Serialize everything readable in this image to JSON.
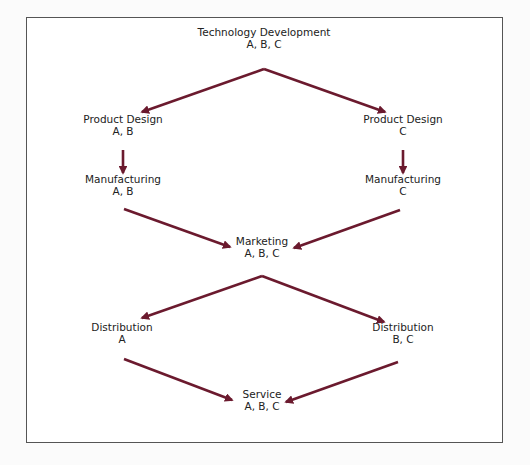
{
  "diagram": {
    "arrow_color": "#6b1a2e",
    "nodes": [
      {
        "id": "tech",
        "label": "Technology Development",
        "sub": "A, B, C",
        "x": 264,
        "y": 38
      },
      {
        "id": "pd_ab",
        "label": "Product Design",
        "sub": "A, B",
        "x": 123,
        "y": 125
      },
      {
        "id": "pd_c",
        "label": "Product Design",
        "sub": "C",
        "x": 403,
        "y": 125
      },
      {
        "id": "mf_ab",
        "label": "Manufacturing",
        "sub": "A, B",
        "x": 123,
        "y": 185
      },
      {
        "id": "mf_c",
        "label": "Manufacturing",
        "sub": "C",
        "x": 403,
        "y": 185
      },
      {
        "id": "mkt",
        "label": "Marketing",
        "sub": "A, B, C",
        "x": 262,
        "y": 247
      },
      {
        "id": "dist_a",
        "label": "Distribution",
        "sub": "A",
        "x": 122,
        "y": 333
      },
      {
        "id": "dist_bc",
        "label": "Distribution",
        "sub": "B, C",
        "x": 403,
        "y": 333
      },
      {
        "id": "svc",
        "label": "Service",
        "sub": "A, B, C",
        "x": 262,
        "y": 400
      }
    ],
    "edges": [
      {
        "from": "tech",
        "to": "pd_ab",
        "x1": 264,
        "y1": 69,
        "x2": 142,
        "y2": 112
      },
      {
        "from": "tech",
        "to": "pd_c",
        "x1": 264,
        "y1": 69,
        "x2": 385,
        "y2": 112
      },
      {
        "from": "pd_ab",
        "to": "mf_ab",
        "x1": 123,
        "y1": 150,
        "x2": 123,
        "y2": 173
      },
      {
        "from": "pd_c",
        "to": "mf_c",
        "x1": 403,
        "y1": 150,
        "x2": 403,
        "y2": 173
      },
      {
        "from": "mf_ab",
        "to": "mkt",
        "x1": 124,
        "y1": 209,
        "x2": 230,
        "y2": 247
      },
      {
        "from": "mf_c",
        "to": "mkt",
        "x1": 400,
        "y1": 210,
        "x2": 294,
        "y2": 248
      },
      {
        "from": "mkt",
        "to": "dist_a",
        "x1": 262,
        "y1": 276,
        "x2": 142,
        "y2": 318
      },
      {
        "from": "mkt",
        "to": "dist_bc",
        "x1": 262,
        "y1": 276,
        "x2": 384,
        "y2": 322
      },
      {
        "from": "dist_a",
        "to": "svc",
        "x1": 124,
        "y1": 359,
        "x2": 232,
        "y2": 400
      },
      {
        "from": "dist_bc",
        "to": "svc",
        "x1": 398,
        "y1": 362,
        "x2": 286,
        "y2": 402
      }
    ]
  }
}
